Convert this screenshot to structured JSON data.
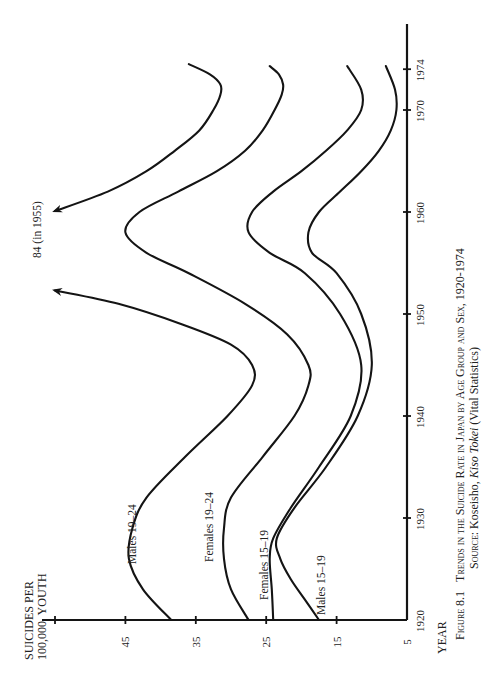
{
  "chart_data": {
    "type": "line",
    "orientation": "rotated-90-ccw",
    "title": "Figure 8.1 Trends in the Suicide Rate in Japan by Age Group and Sex, 1920-1974",
    "title_parts": {
      "figure": "Figure 8.1",
      "text": "Trends in the Suicide Rate in Japan by Age Group and Sex, 1920-1974"
    },
    "source": {
      "prefix": "Source:",
      "publisher": "Koseisho,",
      "work": "Kiso Tokei",
      "note": "(Vital Statistics)"
    },
    "xlabel": "YEAR",
    "ylabel_line1": "SUICIDES PER",
    "ylabel_line2": "100,000  YOUTH",
    "xlim": [
      1920,
      1978
    ],
    "ylim": [
      5,
      55
    ],
    "x_ticks": [
      1920,
      1930,
      1940,
      1950,
      1960,
      1970,
      1974
    ],
    "x_tick_labels": [
      "1920",
      "1930",
      "1940",
      "1950",
      "1960",
      "1970",
      "1974"
    ],
    "y_ticks": [
      5,
      15,
      25,
      35,
      45,
      55
    ],
    "y_tick_labels": [
      "5",
      "15",
      "25",
      "35",
      "45",
      ""
    ],
    "grid": false,
    "annotation": "84 (in 1955)",
    "series": [
      {
        "name": "Males 19-24",
        "label": "Males 19–24",
        "segments": [
          {
            "x": [
              1920,
              1923,
              1926,
              1929,
              1932,
              1936,
              1940,
              1943,
              1945,
              1947,
              1949,
              1951,
              1952.3
            ],
            "y": [
              38.5,
              42.5,
              44.5,
              44,
              42,
              36.5,
              30.5,
              27,
              27,
              30,
              37,
              46,
              55
            ]
          },
          {
            "x": [
              1960.1,
              1962,
              1964,
              1966,
              1968,
              1970,
              1971.5,
              1972.5,
              1973.5,
              1974.5
            ],
            "y": [
              55,
              47.5,
              42,
              38,
              34.5,
              32.5,
              31.5,
              31.5,
              33,
              36
            ]
          }
        ],
        "peak_note": {
          "value": 84,
          "year": 1955
        }
      },
      {
        "name": "Females 19-24",
        "label": "Females 19–24",
        "segments": [
          {
            "x": [
              1920,
              1923,
              1926,
              1929,
              1932,
              1936,
              1940,
              1943,
              1945,
              1948,
              1951,
              1954,
              1956,
              1958,
              1960,
              1962,
              1964,
              1966,
              1968,
              1970,
              1971.5,
              1972.5,
              1973.5,
              1974.3
            ],
            "y": [
              27.5,
              30,
              31,
              31,
              30,
              25.5,
              21,
              19,
              19,
              22,
              28,
              36,
              42,
              45,
              43,
              37.5,
              32,
              28,
              25.5,
              23.8,
              22.8,
              22.6,
              23.2,
              24.5
            ]
          }
        ]
      },
      {
        "name": "Females 15-19",
        "label": "Females 15–19",
        "segments": [
          {
            "x": [
              1920,
              1923,
              1926,
              1928,
              1931,
              1935,
              1940,
              1945,
              1950,
              1954,
              1956,
              1958,
              1960,
              1962,
              1964,
              1966,
              1968,
              1970,
              1972,
              1974.3
            ],
            "y": [
              24,
              24.2,
              24.5,
              24,
              21.5,
              17.5,
              13,
              11.5,
              14.5,
              19.5,
              24.5,
              27.5,
              27,
              24,
              20,
              16.5,
              13.5,
              11.5,
              11.5,
              13.5
            ]
          }
        ]
      },
      {
        "name": "Males 15-19",
        "label": "Males 15–19",
        "segments": [
          {
            "x": [
              1920,
              1922,
              1924,
              1926,
              1928,
              1931,
              1935,
              1940,
              1945,
              1950,
              1954,
              1956,
              1958,
              1960,
              1962,
              1964,
              1966,
              1968,
              1970,
              1972,
              1974.3
            ],
            "y": [
              17.5,
              19.5,
              21.5,
              23,
              23.5,
              21,
              16.5,
              12,
              10,
              11.5,
              15,
              18.5,
              19,
              17.5,
              14.5,
              11.5,
              9,
              7.3,
              6.5,
              6.7,
              8
            ]
          }
        ]
      }
    ]
  }
}
